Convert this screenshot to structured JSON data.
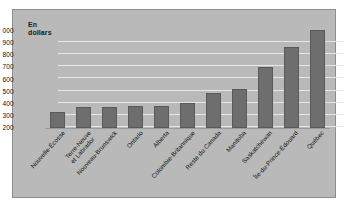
{
  "figure": {
    "background": "#b9b9b9",
    "bar_color": "#6e6e6e",
    "grid_color": "#e6e6e6"
  },
  "chart_data": {
    "type": "bar",
    "title": "",
    "axis_title_line1": "En",
    "axis_title_line2": "dollars",
    "xlabel": "",
    "ylabel": "En dollars",
    "ylim": [
      200,
      1000
    ],
    "grid": true,
    "legend": "none",
    "yticks": [
      "1 000",
      "900",
      "800",
      "700",
      "600",
      "500",
      "400",
      "300",
      "200"
    ],
    "ytick_values": [
      1000,
      900,
      800,
      700,
      600,
      500,
      400,
      300,
      200
    ],
    "categories": [
      "Nouvelle-Écosse",
      "Terre-Neuve et Labrador",
      "Nouveau-Brunswick",
      "Ontario",
      "Alberta",
      "Colombie-Britannique",
      "Reste du Canada",
      "Manitoba",
      "Saskatchewan",
      "Île-du-Prince-Édouard",
      "Québec"
    ],
    "category_lines": [
      [
        "Nouvelle-Écosse"
      ],
      [
        "Terre-Neuve",
        "et Labrador"
      ],
      [
        "Nouveau-Brunswick"
      ],
      [
        "Ontario"
      ],
      [
        "Alberta"
      ],
      [
        "Colombie-Britannique"
      ],
      [
        "Reste du Canada"
      ],
      [
        "Manitoba"
      ],
      [
        "Saskatchewan"
      ],
      [
        "Île-du-Prince-Édouard"
      ],
      [
        "Québec"
      ]
    ],
    "values": [
      330,
      370,
      375,
      380,
      385,
      410,
      490,
      520,
      700,
      870,
      1010
    ]
  }
}
